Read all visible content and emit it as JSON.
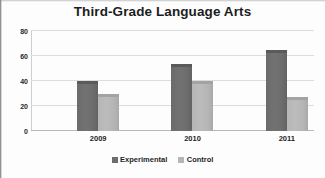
{
  "chart_data": {
    "type": "bar",
    "title": "Third-Grade Language Arts",
    "xlabel": "",
    "ylabel": "",
    "categories": [
      "2009",
      "2010",
      "2011"
    ],
    "series": [
      {
        "name": "Experimental",
        "color": "#6d6d6d",
        "values": [
          40,
          54,
          65
        ]
      },
      {
        "name": "Control",
        "color": "#b6b6b6",
        "values": [
          30,
          40,
          27
        ]
      }
    ],
    "ylim": [
      0,
      80
    ],
    "yticks": [
      0,
      20,
      40,
      60,
      80
    ],
    "ytick_labels": [
      "0",
      "20",
      "40",
      "60",
      "80"
    ],
    "grid": true,
    "legend_position": "bottom"
  },
  "legend": {
    "items": [
      {
        "label": "Experimental",
        "swatch": "legend-swatch-experimental"
      },
      {
        "label": "Control",
        "swatch": "legend-swatch-control"
      }
    ]
  }
}
